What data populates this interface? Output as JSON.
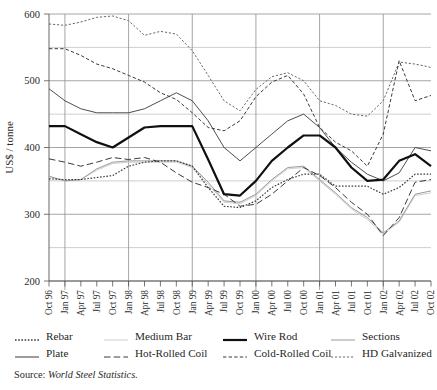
{
  "axis": {
    "y_title": "US$ / tonne",
    "y_ticks": [
      "600",
      "500",
      "400",
      "300",
      "200"
    ],
    "x_ticks": [
      "Oct 96",
      "Jan 97",
      "Apr 97",
      "Jul 97",
      "Oct 97",
      "Jan 98",
      "Apr 98",
      "Jul 98",
      "Oct 98",
      "Jan 99",
      "Apr 99",
      "Jul 99",
      "Oct 99",
      "Jan 00",
      "Apr 00",
      "Jul 00",
      "Oct 00",
      "Jan 01",
      "Apr 01",
      "Jul 01",
      "Oct 01",
      "Jan 02",
      "Apr 02",
      "Jul 02",
      "Oct 02"
    ]
  },
  "legend": {
    "row1": [
      {
        "label": "Rebar",
        "style": "dotted-fine",
        "color": "#3a3a3a"
      },
      {
        "label": "Medium Bar",
        "style": "solid-verylight",
        "color": "#cfcfcf"
      },
      {
        "label": "Wire Rod",
        "style": "solid-thick",
        "color": "#101010"
      },
      {
        "label": "Sections",
        "style": "solid-light",
        "color": "#9a9a9a"
      }
    ],
    "row2": [
      {
        "label": "Plate",
        "style": "solid-thin",
        "color": "#3a3a3a"
      },
      {
        "label": "Hot-Rolled Coil",
        "style": "dashed-long",
        "color": "#3a3a3a"
      },
      {
        "label": "Cold-Rolled Coil",
        "style": "dashed-short",
        "color": "#3a3a3a"
      },
      {
        "label": "HD Galvanized",
        "style": "dotted-med",
        "color": "#6a6a6a"
      }
    ]
  },
  "source": {
    "label": "Source: ",
    "italic": "World Steel Statistics."
  },
  "chart_data": {
    "type": "line",
    "title": "",
    "xlabel": "",
    "ylabel": "US$ / tonne",
    "ylim": [
      200,
      600
    ],
    "ytick_step": 100,
    "minor_gridline_step": 50,
    "grid": true,
    "legend_position": "below",
    "x": [
      "Oct 96",
      "Jan 97",
      "Apr 97",
      "Jul 97",
      "Oct 97",
      "Jan 98",
      "Apr 98",
      "Jul 98",
      "Oct 98",
      "Jan 99",
      "Apr 99",
      "Jul 99",
      "Oct 99",
      "Jan 00",
      "Apr 00",
      "Jul 00",
      "Oct 00",
      "Jan 01",
      "Apr 01",
      "Jul 01",
      "Oct 01",
      "Jan 02",
      "Apr 02",
      "Jul 02",
      "Oct 02"
    ],
    "vertical_gridlines_at": [
      "Jan 97",
      "Jan 98",
      "Jan 99",
      "Jan 00",
      "Jan 01",
      "Jan 02"
    ],
    "series": [
      {
        "name": "HD Galvanized",
        "style": "dotted-med",
        "color": "#6a6a6a",
        "width": 1.0,
        "values": [
          585,
          583,
          588,
          595,
          597,
          590,
          568,
          574,
          570,
          545,
          508,
          470,
          455,
          487,
          506,
          512,
          500,
          470,
          463,
          450,
          447,
          470,
          528,
          525,
          520
        ]
      },
      {
        "name": "Cold-Rolled Coil",
        "style": "dashed-short",
        "color": "#3a3a3a",
        "width": 1.0,
        "values": [
          548,
          548,
          538,
          525,
          518,
          508,
          498,
          482,
          472,
          452,
          430,
          425,
          440,
          476,
          498,
          508,
          480,
          430,
          408,
          395,
          372,
          420,
          530,
          470,
          478
        ]
      },
      {
        "name": "Plate",
        "style": "solid-thin",
        "color": "#3a3a3a",
        "width": 0.9,
        "values": [
          488,
          470,
          458,
          452,
          452,
          452,
          458,
          470,
          482,
          470,
          440,
          400,
          380,
          400,
          420,
          440,
          450,
          430,
          400,
          378,
          360,
          350,
          362,
          400,
          395
        ]
      },
      {
        "name": "Wire Rod",
        "style": "solid-thick",
        "color": "#101010",
        "width": 2.2,
        "values": [
          432,
          432,
          420,
          408,
          400,
          415,
          430,
          432,
          432,
          432,
          382,
          330,
          328,
          350,
          380,
          400,
          418,
          418,
          400,
          370,
          350,
          352,
          380,
          390,
          372
        ]
      },
      {
        "name": "Hot-Rolled Coil",
        "style": "dashed-long",
        "color": "#3a3a3a",
        "width": 1.0,
        "values": [
          383,
          378,
          372,
          378,
          385,
          382,
          385,
          378,
          362,
          348,
          340,
          330,
          312,
          315,
          330,
          350,
          370,
          358,
          340,
          318,
          300,
          268,
          295,
          348,
          352
        ]
      },
      {
        "name": "Rebar",
        "style": "dotted-fine",
        "color": "#3a3a3a",
        "width": 1.2,
        "values": [
          353,
          352,
          352,
          355,
          358,
          372,
          378,
          380,
          380,
          372,
          340,
          312,
          310,
          320,
          340,
          352,
          360,
          360,
          342,
          342,
          342,
          330,
          340,
          360,
          360
        ]
      },
      {
        "name": "Sections",
        "style": "solid-light",
        "color": "#9a9a9a",
        "width": 1.0,
        "values": [
          357,
          350,
          352,
          368,
          378,
          380,
          380,
          380,
          380,
          372,
          348,
          320,
          318,
          330,
          352,
          370,
          372,
          352,
          332,
          310,
          295,
          272,
          290,
          330,
          335
        ]
      },
      {
        "name": "Medium Bar",
        "style": "solid-verylight",
        "color": "#cfcfcf",
        "width": 1.0,
        "values": [
          356,
          350,
          352,
          366,
          376,
          378,
          378,
          378,
          378,
          370,
          345,
          318,
          316,
          328,
          350,
          368,
          370,
          350,
          330,
          308,
          292,
          270,
          288,
          328,
          332
        ]
      }
    ]
  }
}
